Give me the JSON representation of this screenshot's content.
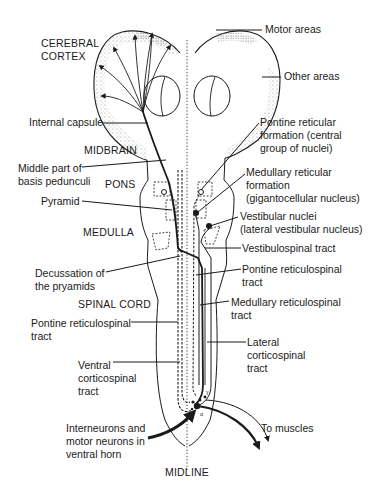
{
  "figure": {
    "regions": {
      "cerebral_cortex": "CEREBRAL\nCORTEX",
      "midbrain": "MIDBRAIN",
      "pons": "PONS",
      "medulla": "MEDULLA",
      "spinal_cord": "SPINAL CORD",
      "midline": "MIDLINE"
    },
    "left_labels": {
      "internal_capsule": "Internal capsule",
      "basis_pedunculi": "Middle part of\nbasis pedunculi",
      "pyramid": "Pyramid",
      "decussation": "Decussation of\nthe pryamids",
      "pontine_reticulospinal_left": "Pontine reticulospinal\ntract",
      "ventral_corticospinal": "Ventral\ncorticospinal\ntract",
      "interneurons": "Interneurons and\nmotor neurons in\nventral horn"
    },
    "right_labels": {
      "motor_areas": "Motor areas",
      "other_areas": "Other areas",
      "pontine_reticular_formation": "Pontine reticular\nformation (central\ngroup of nuclei)",
      "medullary_reticular_formation": "Medullary reticular\nformation\n(gigantocellular nucleus)",
      "vestibular_nuclei": "Vestibular nuclei\n(lateral vestibular nucleus)",
      "vestibulospinal_tract": "Vestibulospinal tract",
      "pontine_reticulospinal_right": "Pontine reticulospinal\ntract",
      "medullary_reticulospinal": "Medullary reticulospinal\ntract",
      "lateral_corticospinal": "Lateral\ncorticospinal\ntract",
      "to_muscles": "To muscles"
    },
    "neuron_symbols": {
      "gamma": "γ",
      "alpha": "α"
    },
    "colors": {
      "ink": "#1a1a1a",
      "stipple": "#9a9a9a",
      "background": "#ffffff"
    }
  }
}
